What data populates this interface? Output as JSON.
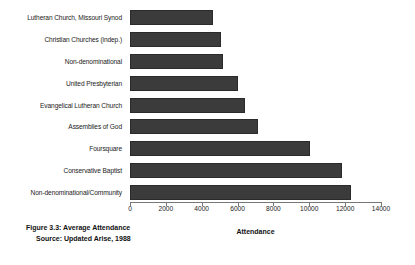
{
  "chart_data": {
    "type": "bar",
    "orientation": "horizontal",
    "title": "",
    "xlabel": "Attendance",
    "ylabel": "",
    "xlim": [
      0,
      14000
    ],
    "xticks": [
      0,
      2000,
      4000,
      6000,
      8000,
      10000,
      12000,
      14000
    ],
    "xtick_labels": [
      "0",
      "2000",
      "4000",
      "6000",
      "8000",
      "10000",
      "12000",
      "14000"
    ],
    "grid": false,
    "legend": null,
    "bar_color": "#3b3b3b",
    "categories": [
      "Lutheran Church, Missouri Synod",
      "Christian Churches (indep.)",
      "Non-denominational",
      "United Presbyterian",
      "Evangelical Lutheran Church",
      "Assemblies of God",
      "Foursquare",
      "Conservative Baptist",
      "Non-denominational/Community"
    ],
    "values": [
      4650,
      5100,
      5200,
      6000,
      6400,
      7150,
      10050,
      11850,
      12300
    ]
  },
  "caption": {
    "line1": "Figure 3.3: Average Attendance",
    "line2": "Source: Updated Arise, 1988"
  }
}
